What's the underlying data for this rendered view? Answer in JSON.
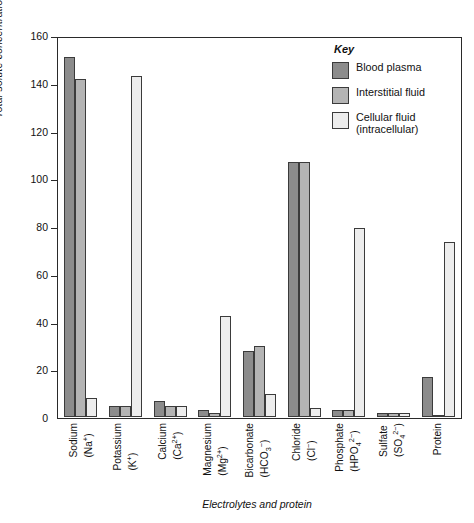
{
  "chart_data": {
    "type": "bar",
    "title": "",
    "xlabel": "Electrolytes and protein",
    "ylabel": "Total solute concentration (m Eq/L of H₂O)",
    "ylim": [
      0,
      160
    ],
    "yticks": [
      0,
      20,
      40,
      60,
      80,
      100,
      120,
      140,
      160
    ],
    "ytick_labels": [
      "0",
      "20",
      "40",
      "60",
      "80",
      "100",
      "120",
      "140",
      "160"
    ],
    "grid": false,
    "legend_position": "top-right",
    "categories": [
      "Sodium (Na+)",
      "Potassium (K+)",
      "Calcium (Ca2+)",
      "Magnesium (Mg2+)",
      "Bicarbonate (HCO3-)",
      "Chloride (Cl-)",
      "Phosphate (HPO42-)",
      "Sulfate (SO42-)",
      "Protein"
    ],
    "series": [
      {
        "name": "Blood plasma",
        "color": "#8c8c8c",
        "values": [
          152,
          5,
          7,
          3,
          28,
          108,
          3,
          2,
          17
        ]
      },
      {
        "name": "Interstitial fluid",
        "color": "#b4b4b4",
        "values": [
          143,
          5,
          5,
          2,
          30,
          108,
          3,
          2,
          1
        ]
      },
      {
        "name": "Cellular fluid (intracellular)",
        "color": "#ededed",
        "values": [
          8,
          144,
          5,
          43,
          10,
          4,
          80,
          2,
          74
        ]
      }
    ]
  },
  "axis": {
    "y_title": "Total solute concentration (m Eq/L of H₂O)",
    "x_title": "Electrolytes and protein",
    "ticks": [
      "160",
      "140",
      "120",
      "100",
      "80",
      "60",
      "40",
      "20",
      "0"
    ]
  },
  "x_categories": [
    {
      "name": "Sodium",
      "ion": "(Na<sup>+</sup>)"
    },
    {
      "name": "Potassium",
      "ion": "(K<sup>+</sup>)"
    },
    {
      "name": "Calcium",
      "ion": "(Ca<sup>2+</sup>)"
    },
    {
      "name": "Magnesium",
      "ion": "(Mg<sup>2+</sup>)"
    },
    {
      "name": "Bicarbonate",
      "ion": "(HCO<sub>3</sub><sup>−</sup>)"
    },
    {
      "name": "Chloride",
      "ion": "(Cl<sup>−</sup>)"
    },
    {
      "name": "Phosphate",
      "ion": "(HPO<sub>4</sub><sup>2−</sup>)"
    },
    {
      "name": "Sulfate",
      "ion": "(SO<sub>4</sub><sup>2−</sup>)"
    },
    {
      "name": "Protein",
      "ion": ""
    }
  ],
  "legend": {
    "title": "Key",
    "items": [
      {
        "label": "Blood plasma",
        "sub": "",
        "color": "#8c8c8c"
      },
      {
        "label": "Interstitial fluid",
        "sub": "",
        "color": "#b4b4b4"
      },
      {
        "label": "Cellular fluid",
        "sub": "(intracellular)",
        "color": "#ededed"
      }
    ]
  }
}
